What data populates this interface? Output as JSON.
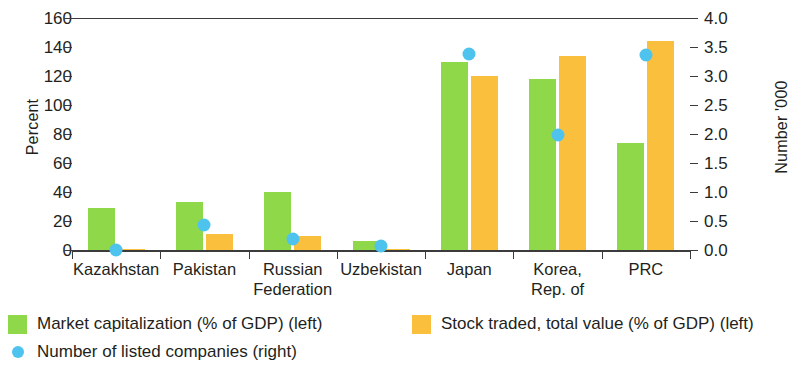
{
  "chart_data": {
    "type": "bar",
    "title": "",
    "subtitle": "",
    "xlabel": "",
    "ylabel": "Percent",
    "ylabel_right": "Number '000",
    "ylim": [
      0,
      160
    ],
    "ylim_right": [
      0,
      4.0
    ],
    "yticks": [
      "0",
      "20",
      "40",
      "60",
      "80",
      "100",
      "120",
      "140",
      "160"
    ],
    "yticks_right": [
      "0.0",
      "0.5",
      "1.0",
      "1.5",
      "2.0",
      "2.5",
      "3.0",
      "3.5",
      "4.0"
    ],
    "grid": false,
    "legend_position": "bottom-left",
    "categories": [
      "Kazakhstan",
      "Pakistan",
      "Russian\nFederation",
      "Uzbekistan",
      "Japan",
      "Korea,\nRep. of",
      "PRC"
    ],
    "series": [
      {
        "name": "Market capitalization (% of GDP) (left)",
        "type": "bar",
        "axis": "left",
        "color": "#8fd84a",
        "values": [
          29,
          33,
          40,
          6,
          130,
          118,
          74
        ]
      },
      {
        "name": "Stock traded, total value (% of GDP) (left)",
        "type": "bar",
        "axis": "left",
        "color": "#fbbf3e",
        "values": [
          1,
          11,
          10,
          1,
          120,
          134,
          144
        ]
      },
      {
        "name": "Number of listed companies (right)",
        "type": "scatter",
        "axis": "right",
        "color": "#4ec3ee",
        "values": [
          0.12,
          0.55,
          0.3,
          0.18,
          3.5,
          2.1,
          3.47
        ]
      }
    ]
  },
  "axes": {
    "left_title": "Percent",
    "right_title": "Number '000"
  },
  "legend": {
    "items": [
      {
        "label": "Market capitalization (% of GDP) (left)",
        "swatch": "green-square"
      },
      {
        "label": "Stock traded, total value (% of GDP) (left)",
        "swatch": "orange-square"
      },
      {
        "label": "Number of listed companies (right)",
        "swatch": "blue-dot"
      }
    ]
  }
}
